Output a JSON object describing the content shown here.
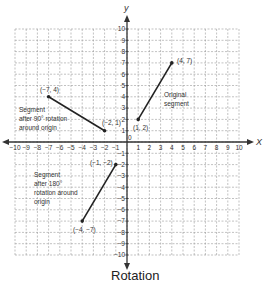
{
  "title": "Rotation",
  "axes": {
    "x_label": "X",
    "y_label": "y",
    "x_ticks": [
      "-10",
      "-9",
      "-8",
      "-7",
      "-6",
      "-5",
      "-4",
      "-3",
      "-2",
      "-1",
      "1",
      "2",
      "3",
      "4",
      "5",
      "6",
      "7",
      "8",
      "9",
      "10"
    ],
    "y_ticks_pos": [
      "1",
      "2",
      "3",
      "4",
      "5",
      "6",
      "7",
      "8",
      "9",
      "10"
    ],
    "y_ticks_neg": [
      "-1",
      "-2",
      "-3",
      "-4",
      "-5",
      "-6",
      "-7",
      "-8",
      "-9",
      "-10"
    ],
    "origin_label": "0",
    "range": [
      -10,
      10
    ]
  },
  "segments": {
    "original": {
      "label_line1": "Original",
      "label_line2": "segment",
      "p1_label": "(1, 2)",
      "p2_label": "(4, 7)"
    },
    "rot90": {
      "label_line1": "Segment",
      "label_line2": "after 90° rotation",
      "label_line3": "around origin",
      "p1_label": "(−7, 4)",
      "p2_label": "(−2, 1)"
    },
    "rot180": {
      "label_line1": "Segment",
      "label_line2": "after 180°",
      "label_line3": "rotation around",
      "label_line4": "origin",
      "p1_label": "(−1, −2)",
      "p2_label": "(−4, −7)"
    }
  },
  "chart_data": {
    "type": "line",
    "title": "Rotation",
    "xlabel": "X",
    "ylabel": "y",
    "xlim": [
      -10,
      10
    ],
    "ylim": [
      -10,
      10
    ],
    "grid": true,
    "series": [
      {
        "name": "Original segment",
        "points": [
          [
            1,
            2
          ],
          [
            4,
            7
          ]
        ]
      },
      {
        "name": "Segment after 90° rotation around origin",
        "points": [
          [
            -7,
            4
          ],
          [
            -2,
            1
          ]
        ]
      },
      {
        "name": "Segment after 180° rotation around origin",
        "points": [
          [
            -1,
            -2
          ],
          [
            -4,
            -7
          ]
        ]
      }
    ]
  }
}
